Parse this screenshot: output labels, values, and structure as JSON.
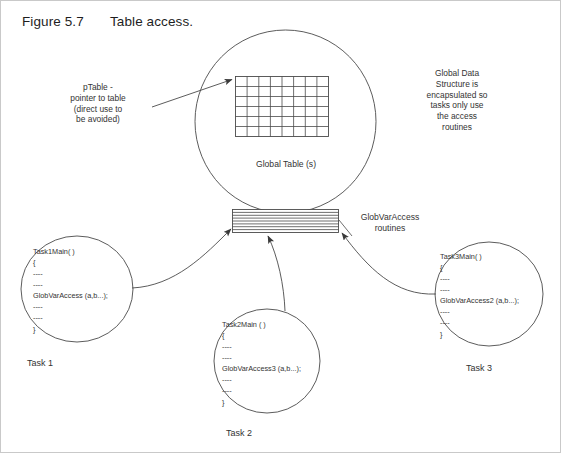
{
  "figure": {
    "label": "Figure 5.7",
    "title": "Table access."
  },
  "annotations": {
    "ptable_note": "pTable -\npointer to table\n(direct use to\nbe avoided)",
    "encapsulation_note": "Global Data\nStructure is\nencapsulated so\ntasks only use\nthe access\nroutines",
    "global_table_label": "Global Table (s)",
    "routines_label": "GlobVarAccess\nroutines"
  },
  "global_table": {
    "columns": 8,
    "rows": 6
  },
  "access_band": {
    "stripe_count": 7
  },
  "tasks": [
    {
      "id": "task1",
      "name": "Task 1",
      "code": "Task1Main( )\n{\n----\n----\nGlobVarAccess (a,b...);\n----\n----\n}"
    },
    {
      "id": "task2",
      "name": "Task 2",
      "code": "Task2Main ( )\n{\n----\n----\nGlobVarAccess3 (a,b...);\n----\n----\n}"
    },
    {
      "id": "task3",
      "name": "Task 3",
      "code": "Task3Main( )\n{\n----\n----\nGlobVarAccess2 (a,b...);\n----\n----\n}"
    }
  ],
  "colors": {
    "stroke": "#4a4a4a",
    "text": "#333333",
    "background": "#ffffff",
    "frame": "#c9c9c9"
  }
}
